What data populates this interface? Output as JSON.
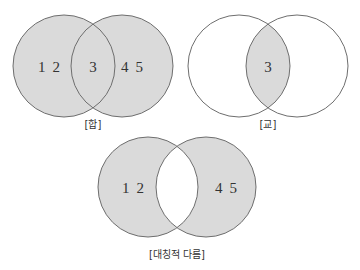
{
  "colors": {
    "fill": "#dadada",
    "stroke": "#6e6e6e",
    "text": "#333333",
    "background": "#ffffff"
  },
  "diagrams": [
    {
      "name": "union",
      "caption": "[합]",
      "left_only": [
        "1",
        "2"
      ],
      "intersection": [
        "3"
      ],
      "right_only": [
        "4",
        "5"
      ],
      "shaded": "left ∪ right"
    },
    {
      "name": "intersection",
      "caption": "[교]",
      "intersection": [
        "3"
      ],
      "shaded": "left ∩ right"
    },
    {
      "name": "symmetric-difference",
      "caption": "[대칭적 다름]",
      "left_only": [
        "1",
        "2"
      ],
      "right_only": [
        "4",
        "5"
      ],
      "shaded": "left △ right"
    }
  ]
}
